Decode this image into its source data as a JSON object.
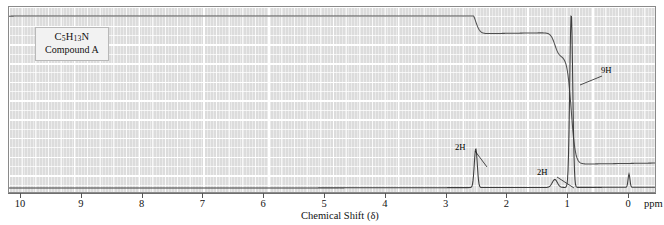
{
  "figure": {
    "kind": "nmr-spectrum",
    "background_color": "#dcdcdc",
    "frame_color": "#8a8a8a",
    "trace_color": "#4a4a4a"
  },
  "sample_label": {
    "formula_prefix": "C",
    "formula_c_count": "5",
    "formula_h": "H",
    "formula_h_count": "13",
    "formula_n": "N",
    "formula_plain": "C5H13N",
    "compound_name": "Compound A"
  },
  "axis": {
    "title": "Chemical Shift (δ)",
    "unit_label": "ppm",
    "ticks": [
      "10",
      "9",
      "8",
      "7",
      "6",
      "5",
      "4",
      "3",
      "2",
      "1",
      "0"
    ],
    "min": 0,
    "max": 10,
    "direction": "reversed"
  },
  "annotations": [
    {
      "label": "2H",
      "shift": 2.52
    },
    {
      "label": "2H",
      "shift": 1.22
    },
    {
      "label": "9H",
      "shift": 0.95
    }
  ],
  "chart_data": {
    "type": "line",
    "title": "",
    "xlabel": "Chemical Shift (δ)",
    "ylabel": "",
    "xlim": [
      10,
      0
    ],
    "ylim": [
      0,
      1
    ],
    "grid": true,
    "legend": "none",
    "series": [
      {
        "name": "spectrum",
        "peaks": [
          {
            "shift": 2.52,
            "height": 0.22,
            "width": 0.035,
            "label": "2H"
          },
          {
            "shift": 1.22,
            "height": 0.045,
            "width": 0.06,
            "label": "2H"
          },
          {
            "shift": 0.95,
            "height": 0.98,
            "width": 0.035,
            "label": "9H"
          },
          {
            "shift": 0.0,
            "height": 0.075,
            "width": 0.022,
            "label": "TMS"
          }
        ],
        "baseline": 0.0
      },
      {
        "name": "integral",
        "steps": [
          {
            "shift": 2.52,
            "rise": 0.155,
            "label": "2H"
          },
          {
            "shift": 1.22,
            "rise": 0.155,
            "label": "2H"
          },
          {
            "shift": 0.95,
            "rise": 0.69,
            "label": "9H"
          }
        ]
      }
    ]
  }
}
